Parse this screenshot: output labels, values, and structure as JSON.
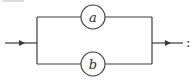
{
  "diagram": {
    "type": "parallel-composition",
    "top_fragment_text": "",
    "nodes": [
      {
        "id": "a",
        "label": "a",
        "branch": "top"
      },
      {
        "id": "b",
        "label": "b",
        "branch": "bottom"
      }
    ],
    "input_arrow": "→",
    "output_arrow": "→",
    "trailing_punctuation": ":",
    "colors": {
      "stroke": "#3a3a3a",
      "background": "#ffffff"
    }
  }
}
